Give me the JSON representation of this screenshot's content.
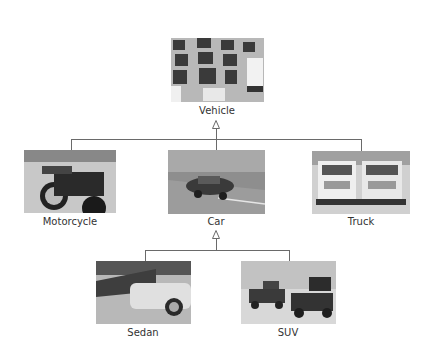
{
  "diagram": {
    "type": "class-hierarchy",
    "colors": {
      "line": "#6a6a6a",
      "label": "#333333",
      "background": "#ffffff"
    },
    "nodes": {
      "vehicle": {
        "label": "Vehicle",
        "image": "traffic-jam-photo"
      },
      "motorcycle": {
        "label": "Motorcycle",
        "image": "motorcycles-photo"
      },
      "car": {
        "label": "Car",
        "image": "car-on-road-photo"
      },
      "truck": {
        "label": "Truck",
        "image": "dump-trucks-photo"
      },
      "sedan": {
        "label": "Sedan",
        "image": "parked-sedans-photo"
      },
      "suv": {
        "label": "SUV",
        "image": "suvs-desert-photo"
      }
    },
    "edges": [
      {
        "from": "motorcycle",
        "to": "vehicle",
        "arrow": "hollow-triangle"
      },
      {
        "from": "car",
        "to": "vehicle",
        "arrow": "hollow-triangle"
      },
      {
        "from": "truck",
        "to": "vehicle",
        "arrow": "hollow-triangle"
      },
      {
        "from": "sedan",
        "to": "car",
        "arrow": "hollow-triangle"
      },
      {
        "from": "suv",
        "to": "car",
        "arrow": "hollow-triangle"
      }
    ]
  }
}
